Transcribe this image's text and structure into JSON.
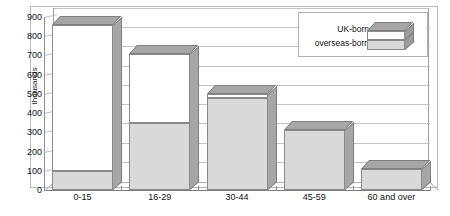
{
  "chart_data": {
    "type": "bar",
    "subtype": "stacked-column-3d",
    "title": "",
    "xlabel": "",
    "ylabel": "thousands",
    "ylim": [
      0,
      900
    ],
    "ytick_step": 100,
    "yticks": [
      900,
      800,
      700,
      600,
      500,
      400,
      300,
      200,
      100,
      0
    ],
    "ytick_labels": [
      "900",
      "800",
      "700",
      "600",
      "500",
      "400",
      "300",
      "200",
      "100",
      "0"
    ],
    "categories": [
      "0-15",
      "16-29",
      "30-44",
      "45-59",
      "60 and over"
    ],
    "grid": true,
    "grid_axis": "y",
    "legend_position": "top-right",
    "stack_order_bottom_to_top": [
      "overseas-born",
      "UK-born"
    ],
    "series": [
      {
        "name": "overseas-born",
        "color": "#d9d9d9",
        "values": [
          100,
          350,
          480,
          310,
          110
        ]
      },
      {
        "name": "UK-born",
        "color": "#ffffff",
        "values": [
          760,
          360,
          20,
          0,
          0
        ]
      }
    ],
    "totals": [
      860,
      710,
      500,
      310,
      110
    ]
  },
  "legend": {
    "entries": [
      {
        "label": "UK-born",
        "color": "#ffffff"
      },
      {
        "label": "overseas-born",
        "color": "#d9d9d9"
      }
    ]
  },
  "axis": {
    "y_title": "thousands"
  },
  "style": {
    "bar_face_gray": "#d9d9d9",
    "bar_face_white": "#ffffff",
    "bar_side_gray": "#a6a6a6",
    "bar_outline": "#8a8a8a",
    "gridline": "#c4c4c4",
    "frame": "#b9b9b9",
    "text": "#111111",
    "background": "#ffffff"
  }
}
